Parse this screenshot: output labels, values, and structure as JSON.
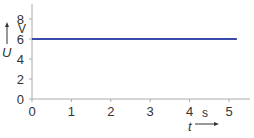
{
  "chart_data": {
    "type": "line",
    "title": "",
    "xlabel": "t",
    "xunit": "s",
    "ylabel": "U",
    "yunit": "V",
    "x": [
      0,
      5.2
    ],
    "series": [
      {
        "name": "U",
        "values": [
          6,
          6
        ],
        "color": "#3a4aa8"
      }
    ],
    "xticks": [
      "0",
      "1",
      "2",
      "3",
      "4",
      "5"
    ],
    "yticks": [
      "0",
      "2",
      "4",
      "6",
      "8"
    ],
    "xlim": [
      0,
      5.5
    ],
    "ylim": [
      0,
      9
    ],
    "grid": false,
    "legend": "none"
  }
}
